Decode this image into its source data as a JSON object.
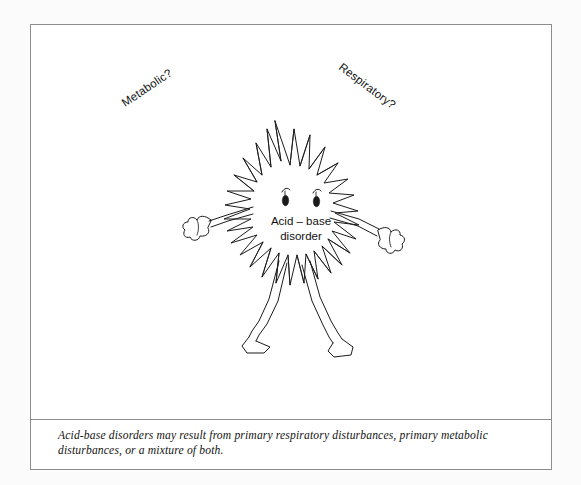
{
  "figure": {
    "frame": {
      "border_color": "#8d8d8d",
      "background": "#ffffff"
    },
    "illustration": {
      "title": "acid-base disorder creature",
      "center_label_line1": "Acid – base",
      "center_label_line2": "disorder",
      "left_label": "Metabolic?",
      "right_label": "Respiratory?",
      "ink_color": "#1b1b1b"
    },
    "caption": "Acid-base disorders may result from primary respiratory disturbances, primary metabolic disturbances, or a mixture of both."
  }
}
